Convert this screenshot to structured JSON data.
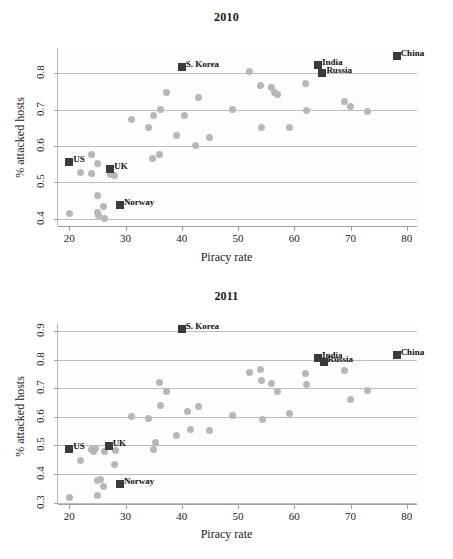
{
  "figure": {
    "xlabel": "Piracy rate",
    "ylabel": "% attacked hosts",
    "marker_color": "#b7b7b7",
    "highlight_color": "#3a3a3a",
    "grid_color": "#b9bec4"
  },
  "chart_data": [
    {
      "type": "scatter",
      "title": "2010",
      "xlabel": "Piracy rate",
      "ylabel": "% attacked hosts",
      "xlim": [
        18,
        82
      ],
      "ylim": [
        0.38,
        0.87
      ],
      "xticks": [
        20,
        30,
        40,
        50,
        60,
        70,
        80
      ],
      "yticks": [
        0.4,
        0.5,
        0.6,
        0.7,
        0.8
      ],
      "grid": "horizontal",
      "legend": "none",
      "series": [
        {
          "name": "countries",
          "points": [
            [
              20.0,
              0.415
            ],
            [
              22.0,
              0.528
            ],
            [
              24.0,
              0.578
            ],
            [
              24.0,
              0.524
            ],
            [
              25.0,
              0.552
            ],
            [
              25.0,
              0.464
            ],
            [
              25.0,
              0.416
            ],
            [
              25.2,
              0.408
            ],
            [
              26.0,
              0.434
            ],
            [
              26.2,
              0.402
            ],
            [
              27.3,
              0.523
            ],
            [
              28.0,
              0.52
            ],
            [
              31.0,
              0.672
            ],
            [
              34.0,
              0.652
            ],
            [
              34.8,
              0.566
            ],
            [
              35.0,
              0.683
            ],
            [
              36.0,
              0.576
            ],
            [
              36.2,
              0.7
            ],
            [
              37.3,
              0.747
            ],
            [
              39.0,
              0.63
            ],
            [
              40.5,
              0.683
            ],
            [
              42.5,
              0.601
            ],
            [
              43.0,
              0.735
            ],
            [
              45.0,
              0.625
            ],
            [
              49.0,
              0.7
            ],
            [
              52.0,
              0.805
            ],
            [
              54.0,
              0.767
            ],
            [
              54.2,
              0.652
            ],
            [
              56.0,
              0.762
            ],
            [
              56.5,
              0.748
            ],
            [
              57.0,
              0.743
            ],
            [
              59.2,
              0.65
            ],
            [
              62.0,
              0.772
            ],
            [
              62.2,
              0.699
            ],
            [
              69.0,
              0.722
            ],
            [
              70.0,
              0.708
            ],
            [
              73.0,
              0.694
            ]
          ]
        }
      ],
      "highlights": [
        {
          "label": "US",
          "x": 20.0,
          "y": 0.555,
          "label_pos": "right"
        },
        {
          "label": "UK",
          "x": 27.3,
          "y": 0.538,
          "label_pos": "right"
        },
        {
          "label": "Norway",
          "x": 29.0,
          "y": 0.437,
          "label_pos": "right"
        },
        {
          "label": "S. Korea",
          "x": 40.0,
          "y": 0.817,
          "label_pos": "right"
        },
        {
          "label": "India",
          "x": 64.2,
          "y": 0.822,
          "label_pos": "right"
        },
        {
          "label": "Russia",
          "x": 65.0,
          "y": 0.802,
          "label_pos": "right"
        },
        {
          "label": "China",
          "x": 78.2,
          "y": 0.848,
          "label_pos": "right"
        }
      ]
    },
    {
      "type": "scatter",
      "title": "2011",
      "xlabel": "Piracy rate",
      "ylabel": "% attacked hosts",
      "xlim": [
        18,
        82
      ],
      "ylim": [
        0.295,
        0.925
      ],
      "xticks": [
        20,
        30,
        40,
        50,
        60,
        70,
        80
      ],
      "yticks": [
        0.3,
        0.4,
        0.5,
        0.6,
        0.7,
        0.8,
        0.9
      ],
      "grid": "horizontal",
      "legend": "none",
      "series": [
        {
          "name": "countries",
          "points": [
            [
              20.0,
              0.318
            ],
            [
              22.0,
              0.446
            ],
            [
              24.0,
              0.485
            ],
            [
              24.3,
              0.48
            ],
            [
              24.6,
              0.488
            ],
            [
              25.0,
              0.378
            ],
            [
              25.0,
              0.325
            ],
            [
              25.5,
              0.382
            ],
            [
              26.0,
              0.358
            ],
            [
              26.2,
              0.48
            ],
            [
              28.0,
              0.434
            ],
            [
              28.2,
              0.482
            ],
            [
              31.0,
              0.602
            ],
            [
              34.0,
              0.594
            ],
            [
              35.0,
              0.487
            ],
            [
              35.3,
              0.512
            ],
            [
              36.0,
              0.722
            ],
            [
              36.2,
              0.64
            ],
            [
              37.2,
              0.69
            ],
            [
              39.0,
              0.534
            ],
            [
              41.0,
              0.62
            ],
            [
              41.5,
              0.555
            ],
            [
              43.0,
              0.636
            ],
            [
              45.0,
              0.553
            ],
            [
              49.0,
              0.606
            ],
            [
              52.0,
              0.757
            ],
            [
              54.0,
              0.766
            ],
            [
              54.2,
              0.726
            ],
            [
              54.4,
              0.59
            ],
            [
              56.0,
              0.716
            ],
            [
              57.0,
              0.688
            ],
            [
              59.2,
              0.611
            ],
            [
              62.0,
              0.752
            ],
            [
              62.2,
              0.714
            ],
            [
              69.0,
              0.762
            ],
            [
              70.0,
              0.66
            ],
            [
              73.0,
              0.694
            ]
          ]
        }
      ],
      "highlights": [
        {
          "label": "US",
          "x": 20.0,
          "y": 0.487,
          "label_pos": "right"
        },
        {
          "label": "UK",
          "x": 27.0,
          "y": 0.497,
          "label_pos": "right"
        },
        {
          "label": "Norway",
          "x": 29.0,
          "y": 0.365,
          "label_pos": "right"
        },
        {
          "label": "S. Korea",
          "x": 40.0,
          "y": 0.907,
          "label_pos": "right"
        },
        {
          "label": "India",
          "x": 64.2,
          "y": 0.806,
          "label_pos": "right"
        },
        {
          "label": "Russia",
          "x": 65.2,
          "y": 0.793,
          "label_pos": "right"
        },
        {
          "label": "China",
          "x": 78.2,
          "y": 0.817,
          "label_pos": "right"
        }
      ]
    }
  ]
}
